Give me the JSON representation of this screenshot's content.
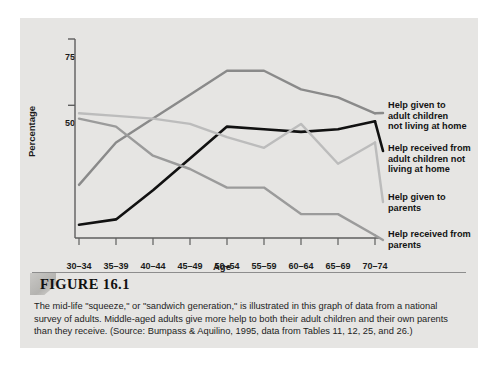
{
  "figure": {
    "number_label": "FIGURE 16.1",
    "caption": "The mid-life \"squeeze,\" or \"sandwich generation,\" is illustrated in this graph of data from a national survey of adults. Middle-aged adults give more help to both their adult children and their own parents than they receive. (Source: Bumpass & Aquilino, 1995, data from Tables 11, 12, 25, and 26.)"
  },
  "chart_data": {
    "type": "line",
    "title": "",
    "xlabel": "Age",
    "ylabel": "Percentage",
    "categories": [
      "30–34",
      "35–39",
      "40–44",
      "45–49",
      "50–54",
      "55–59",
      "60–64",
      "65–69",
      "70–74"
    ],
    "yticks": [
      50,
      75
    ],
    "ytick_labels": [
      "50",
      "75"
    ],
    "ylim": [
      0,
      75
    ],
    "grid": false,
    "legend_position": "right-inline-annotations",
    "series": [
      {
        "name": "Help given to adult children not living at home",
        "label_lines": "Help given to\nadult children\nnot living at home",
        "color": "#8a8a8a",
        "values": [
          20,
          36,
          45,
          54,
          63,
          63,
          56,
          53,
          47
        ]
      },
      {
        "name": "Help received from adult children not living at home",
        "label_lines": "Help received from\nadult children not\nliving at home",
        "color": "#111111",
        "values": [
          5,
          7,
          18,
          30,
          42,
          41,
          40,
          41,
          44
        ]
      },
      {
        "name": "Help given to parents",
        "label_lines": "Help given to\nparents",
        "color": "#bcbcbc",
        "values": [
          47,
          46,
          45,
          43,
          38,
          34,
          43,
          28,
          36
        ]
      },
      {
        "name": "Help received from parents",
        "label_lines": "Help received from\nparents",
        "color": "#9b9b9b",
        "values": [
          45,
          42,
          31,
          26,
          19,
          19,
          9,
          9,
          1
        ]
      }
    ]
  },
  "colors": {
    "panel_background": "#e6e5e3",
    "axis": "#5e5e5e",
    "text": "#1b1b1b",
    "series_dark_gray": "#8a8a8a",
    "series_black": "#111111",
    "series_light_gray": "#bcbcbc",
    "series_mid_gray": "#9b9b9b"
  }
}
